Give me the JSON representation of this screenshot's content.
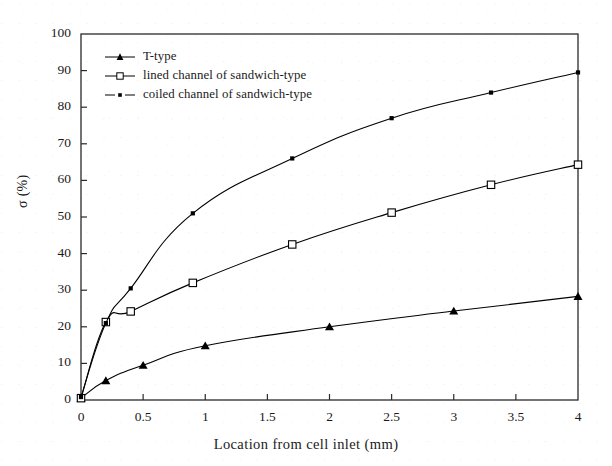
{
  "chart_data": {
    "type": "line",
    "title": "",
    "xlabel": "Location from cell inlet (mm)",
    "ylabel": "σ (%)",
    "xlim": [
      0,
      4
    ],
    "ylim": [
      0,
      100
    ],
    "xticks": [
      "0",
      "0.5",
      "1",
      "1.5",
      "2",
      "2.5",
      "3",
      "3.5",
      "4"
    ],
    "xtick_values": [
      0,
      0.5,
      1,
      1.5,
      2,
      2.5,
      3,
      3.5,
      4
    ],
    "yticks": [
      "0",
      "10",
      "20",
      "30",
      "40",
      "50",
      "60",
      "70",
      "80",
      "90",
      "100"
    ],
    "ytick_values": [
      0,
      10,
      20,
      30,
      40,
      50,
      60,
      70,
      80,
      90,
      100
    ],
    "grid": false,
    "legend_position": "upper-left-inside",
    "series": [
      {
        "name": "T-type",
        "marker": "filled-triangle",
        "color": "#000000",
        "x": [
          0,
          0.2,
          0.5,
          1,
          2,
          3,
          4
        ],
        "values": [
          0.5,
          5.3,
          9.5,
          14.8,
          20.0,
          24.3,
          28.3
        ]
      },
      {
        "name": "lined channel of sandwich-type",
        "marker": "open-square",
        "color": "#000000",
        "x": [
          0,
          0.2,
          0.4,
          0.9,
          1.7,
          2.5,
          3.3,
          4
        ],
        "values": [
          0.5,
          21.3,
          24.2,
          32.0,
          42.5,
          51.2,
          58.8,
          64.3
        ]
      },
      {
        "name": "coiled channel of sandwich-type",
        "marker": "small-filled-square",
        "color": "#000000",
        "x": [
          0,
          0.2,
          0.4,
          0.9,
          1.7,
          2.5,
          3.3,
          4
        ],
        "values": [
          0.8,
          21.0,
          30.5,
          51.0,
          66.0,
          77.0,
          84.0,
          89.5
        ]
      }
    ]
  },
  "axes": {
    "y_title": "σ (%)",
    "x_title": "Location from cell inlet (mm)"
  },
  "legend": {
    "items": [
      {
        "label": "T-type"
      },
      {
        "label": "lined channel of sandwich-type"
      },
      {
        "label": "coiled channel of sandwich-type"
      }
    ]
  }
}
